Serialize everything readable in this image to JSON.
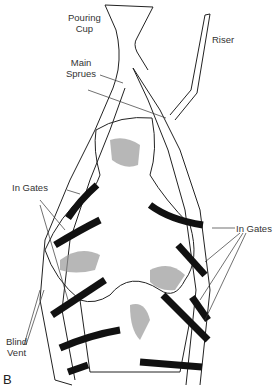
{
  "figure": {
    "panel_label": "B",
    "labels": {
      "pouring_cup": [
        "Pouring",
        "Cup"
      ],
      "riser": "Riser",
      "main_sprues": [
        "Main",
        "Sprues"
      ],
      "in_gates_left": "In Gates",
      "in_gates_right": "In Gates",
      "blind_vent": [
        "Blind",
        "Vent"
      ]
    },
    "colors": {
      "line": "#222222",
      "gate": "#111111",
      "shade": "#999999"
    }
  }
}
